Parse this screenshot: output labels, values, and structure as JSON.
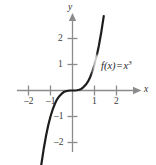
{
  "chart_data": {
    "type": "line",
    "title": "",
    "subtitle": "",
    "xlabel": "x",
    "ylabel": "y",
    "xlim": [
      -2.6,
      2.6
    ],
    "ylim": [
      -2.75,
      2.75
    ],
    "grid": false,
    "legend": "none",
    "annotations": [
      {
        "name": "function-label",
        "text_parts": {
          "fname": "f(x)",
          "equals": "=",
          "base": "x",
          "exponent": "3"
        },
        "plain_text": "f(x) = x³",
        "x": 1.55,
        "y": 0.95
      }
    ],
    "xticks": [
      -2,
      -1,
      1,
      2
    ],
    "xtick_labels": [
      "–2",
      "–1",
      "1",
      "2"
    ],
    "yticks": [
      -2,
      -1,
      1,
      2
    ],
    "ytick_labels": [
      "–2",
      "–1",
      "1",
      "2"
    ],
    "series": [
      {
        "name": "f(x) = x^3",
        "expression": "x^3",
        "color": "#1c1c1c",
        "linewidth": 2.2,
        "x": [
          -1.42,
          -1.3,
          -1.2,
          -1.1,
          -1.0,
          -0.9,
          -0.8,
          -0.7,
          -0.6,
          -0.5,
          -0.4,
          -0.3,
          -0.2,
          -0.1,
          0.0,
          0.1,
          0.2,
          0.3,
          0.4,
          0.5,
          0.6,
          0.7,
          0.8,
          0.9,
          1.0,
          1.1,
          1.2,
          1.3,
          1.42
        ],
        "y": [
          -2.86,
          -2.2,
          -1.73,
          -1.33,
          -1.0,
          -0.73,
          -0.51,
          -0.34,
          -0.22,
          -0.13,
          -0.06,
          -0.03,
          -0.01,
          0.0,
          0.0,
          0.0,
          0.01,
          0.03,
          0.06,
          0.13,
          0.22,
          0.34,
          0.51,
          0.73,
          1.0,
          1.33,
          1.73,
          2.2,
          2.86
        ]
      }
    ],
    "style": {
      "axis_color": "#8c8c8c",
      "tick_color": "#8c8c8c",
      "label_color": "#3a3a3a",
      "curve_color": "#1c1c1c",
      "background": "#ffffff",
      "arrow_heads": [
        "x-positive",
        "y-positive"
      ]
    }
  },
  "axes": {
    "y_axis_name": "y",
    "x_axis_name": "x"
  },
  "ticks": {
    "x_neg_2": "–2",
    "x_neg_1": "–1",
    "x_pos_1": "1",
    "x_pos_2": "2",
    "y_neg_2": "–2",
    "y_neg_1": "–1",
    "y_pos_1": "1",
    "y_pos_2": "2"
  },
  "function_label": {
    "name": "f(x)",
    "equals": "=",
    "base": "x",
    "exponent": "3"
  }
}
